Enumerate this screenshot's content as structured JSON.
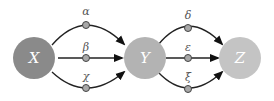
{
  "nodes": {
    "x": {
      "label": "X",
      "color": "#8a8a8a"
    },
    "y": {
      "label": "Y",
      "color": "#b3b3b3"
    },
    "z": {
      "label": "Z",
      "color": "#c4c4c4"
    }
  },
  "edges_xy": [
    {
      "label": "α"
    },
    {
      "label": "β"
    },
    {
      "label": "χ"
    }
  ],
  "edges_yz": [
    {
      "label": "δ"
    },
    {
      "label": "ε"
    },
    {
      "label": "ξ"
    }
  ],
  "colors": {
    "edge": "#222222",
    "midpoint": "#a8a8a8"
  }
}
